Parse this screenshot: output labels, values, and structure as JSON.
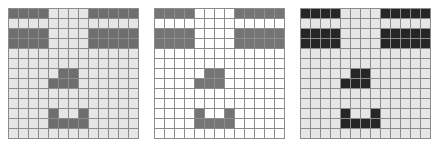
{
  "figure": {
    "type": "pixel-grid-triptych",
    "width": 438,
    "height": 146,
    "background": "#ffffff",
    "panel_count": 3,
    "grid_rows": 13,
    "grid_cols": 13,
    "cell_size_px": 9,
    "gridline_color": "#8c8c8c"
  },
  "legend": {
    "on_label": "1",
    "off_label": "0"
  },
  "panels": [
    {
      "id": "panel-1",
      "name": "grid-left",
      "label": "",
      "on_color": "#6e6e6e",
      "off_color": "#e6e6e6",
      "gridline_color": "#8c8c8c",
      "matrix": [
        [
          1,
          1,
          1,
          1,
          0,
          0,
          0,
          0,
          1,
          1,
          1,
          1,
          1
        ],
        [
          0,
          0,
          0,
          0,
          0,
          0,
          0,
          0,
          0,
          0,
          0,
          0,
          0
        ],
        [
          1,
          1,
          1,
          1,
          0,
          0,
          0,
          0,
          1,
          1,
          1,
          1,
          1
        ],
        [
          1,
          1,
          1,
          1,
          0,
          0,
          0,
          0,
          1,
          1,
          1,
          1,
          1
        ],
        [
          0,
          0,
          0,
          0,
          0,
          0,
          0,
          0,
          0,
          0,
          0,
          0,
          0
        ],
        [
          0,
          0,
          0,
          0,
          0,
          0,
          0,
          0,
          0,
          0,
          0,
          0,
          0
        ],
        [
          0,
          0,
          0,
          0,
          0,
          1,
          1,
          0,
          0,
          0,
          0,
          0,
          0
        ],
        [
          0,
          0,
          0,
          0,
          1,
          1,
          1,
          0,
          0,
          0,
          0,
          0,
          0
        ],
        [
          0,
          0,
          0,
          0,
          0,
          0,
          0,
          0,
          0,
          0,
          0,
          0,
          0
        ],
        [
          0,
          0,
          0,
          0,
          0,
          0,
          0,
          0,
          0,
          0,
          0,
          0,
          0
        ],
        [
          0,
          0,
          0,
          0,
          1,
          0,
          0,
          1,
          0,
          0,
          0,
          0,
          0
        ],
        [
          0,
          0,
          0,
          0,
          1,
          1,
          1,
          1,
          0,
          0,
          0,
          0,
          0
        ],
        [
          0,
          0,
          0,
          0,
          0,
          0,
          0,
          0,
          0,
          0,
          0,
          0,
          0
        ]
      ]
    },
    {
      "id": "panel-2",
      "name": "grid-middle",
      "label": "",
      "on_color": "#757575",
      "off_color": "#ffffff",
      "gridline_color": "#8c8c8c",
      "matrix": [
        [
          1,
          1,
          1,
          1,
          0,
          0,
          0,
          0,
          1,
          1,
          1,
          1,
          1
        ],
        [
          0,
          0,
          0,
          0,
          0,
          0,
          0,
          0,
          0,
          0,
          0,
          0,
          0
        ],
        [
          1,
          1,
          1,
          1,
          0,
          0,
          0,
          0,
          1,
          1,
          1,
          1,
          1
        ],
        [
          1,
          1,
          1,
          1,
          0,
          0,
          0,
          0,
          1,
          1,
          1,
          1,
          1
        ],
        [
          0,
          0,
          0,
          0,
          0,
          0,
          0,
          0,
          0,
          0,
          0,
          0,
          0
        ],
        [
          0,
          0,
          0,
          0,
          0,
          0,
          0,
          0,
          0,
          0,
          0,
          0,
          0
        ],
        [
          0,
          0,
          0,
          0,
          0,
          1,
          1,
          0,
          0,
          0,
          0,
          0,
          0
        ],
        [
          0,
          0,
          0,
          0,
          1,
          1,
          1,
          0,
          0,
          0,
          0,
          0,
          0
        ],
        [
          0,
          0,
          0,
          0,
          0,
          0,
          0,
          0,
          0,
          0,
          0,
          0,
          0
        ],
        [
          0,
          0,
          0,
          0,
          0,
          0,
          0,
          0,
          0,
          0,
          0,
          0,
          0
        ],
        [
          0,
          0,
          0,
          0,
          1,
          0,
          0,
          1,
          0,
          0,
          0,
          0,
          0
        ],
        [
          0,
          0,
          0,
          0,
          1,
          1,
          1,
          1,
          0,
          0,
          0,
          0,
          0
        ],
        [
          0,
          0,
          0,
          0,
          0,
          0,
          0,
          0,
          0,
          0,
          0,
          0,
          0
        ]
      ]
    },
    {
      "id": "panel-3",
      "name": "grid-right",
      "label": "",
      "on_color": "#262626",
      "off_color": "#e6e6e6",
      "gridline_color": "#8c8c8c",
      "matrix": [
        [
          1,
          1,
          1,
          1,
          0,
          0,
          0,
          0,
          1,
          1,
          1,
          1,
          1
        ],
        [
          0,
          0,
          0,
          0,
          0,
          0,
          0,
          0,
          0,
          0,
          0,
          0,
          0
        ],
        [
          1,
          1,
          1,
          1,
          0,
          0,
          0,
          0,
          1,
          1,
          1,
          1,
          1
        ],
        [
          1,
          1,
          1,
          1,
          0,
          0,
          0,
          0,
          1,
          1,
          1,
          1,
          1
        ],
        [
          0,
          0,
          0,
          0,
          0,
          0,
          0,
          0,
          0,
          0,
          0,
          0,
          0
        ],
        [
          0,
          0,
          0,
          0,
          0,
          0,
          0,
          0,
          0,
          0,
          0,
          0,
          0
        ],
        [
          0,
          0,
          0,
          0,
          0,
          1,
          1,
          0,
          0,
          0,
          0,
          0,
          0
        ],
        [
          0,
          0,
          0,
          0,
          1,
          1,
          1,
          0,
          0,
          0,
          0,
          0,
          0
        ],
        [
          0,
          0,
          0,
          0,
          0,
          0,
          0,
          0,
          0,
          0,
          0,
          0,
          0
        ],
        [
          0,
          0,
          0,
          0,
          0,
          0,
          0,
          0,
          0,
          0,
          0,
          0,
          0
        ],
        [
          0,
          0,
          0,
          0,
          1,
          0,
          0,
          1,
          0,
          0,
          0,
          0,
          0
        ],
        [
          0,
          0,
          0,
          0,
          1,
          1,
          1,
          1,
          0,
          0,
          0,
          0,
          0
        ],
        [
          0,
          0,
          0,
          0,
          0,
          0,
          0,
          0,
          0,
          0,
          0,
          0,
          0
        ]
      ]
    }
  ]
}
